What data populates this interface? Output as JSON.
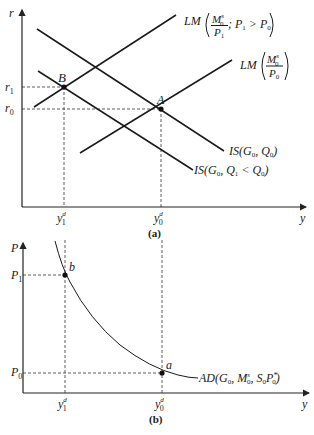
{
  "panel_a": {
    "caption": "(a)",
    "y_axis_label": "r",
    "x_axis_label": "y",
    "r1_label": "r",
    "r1_sub": "1",
    "r0_label": "r",
    "r0_sub": "0",
    "y1_label": "y",
    "y1_sup": "d",
    "y1_sub": "1",
    "y0_label": "y",
    "y0_sup": "d",
    "y0_sub": "0",
    "point_B": "B",
    "point_A": "A",
    "lm1_prefix": "LM",
    "lm1_num": "M",
    "lm1_num_sup": "s",
    "lm1_num_sub": "0",
    "lm1_den": "P",
    "lm1_den_sub": "1",
    "lm1_cond": "; P",
    "lm1_cond_sub1": "1",
    "lm1_cond_op": " > P",
    "lm1_cond_sub0": "0",
    "lm0_prefix": "LM",
    "lm0_num": "M",
    "lm0_num_sup": "s",
    "lm0_num_sub": "0",
    "lm0_den": "P",
    "lm0_den_sub": "0",
    "is0_label": "IS(G",
    "is0_sub_g": "0",
    "is0_mid": ", Q",
    "is0_sub_q": "0",
    "is0_end": ")",
    "is1_label": "IS(G",
    "is1_sub_g": "0",
    "is1_mid": ", Q",
    "is1_sub_q1": "1",
    "is1_op": " < Q",
    "is1_sub_q0": "0",
    "is1_end": ")"
  },
  "panel_b": {
    "caption": "(b)",
    "y_axis_label": "P",
    "x_axis_label": "y",
    "p1_label": "P",
    "p1_sub": "1",
    "p0_label": "P",
    "p0_sub": "0",
    "y1_label": "y",
    "y1_sup": "d",
    "y1_sub": "1",
    "y0_label": "y",
    "y0_sup": "d",
    "y0_sub": "0",
    "point_b": "b",
    "point_a": "a",
    "ad_label": "AD(G",
    "ad_sub_g": "0",
    "ad_m": ", M",
    "ad_m_sup": "s",
    "ad_m_sub": "0",
    "ad_s": ", S",
    "ad_s_sub": "0",
    "ad_p": "P",
    "ad_p_sup": "*",
    "ad_p_sub": "0",
    "ad_end": ")"
  },
  "colors": {
    "ink": "#1a1a1a",
    "background": "#ffffff"
  }
}
